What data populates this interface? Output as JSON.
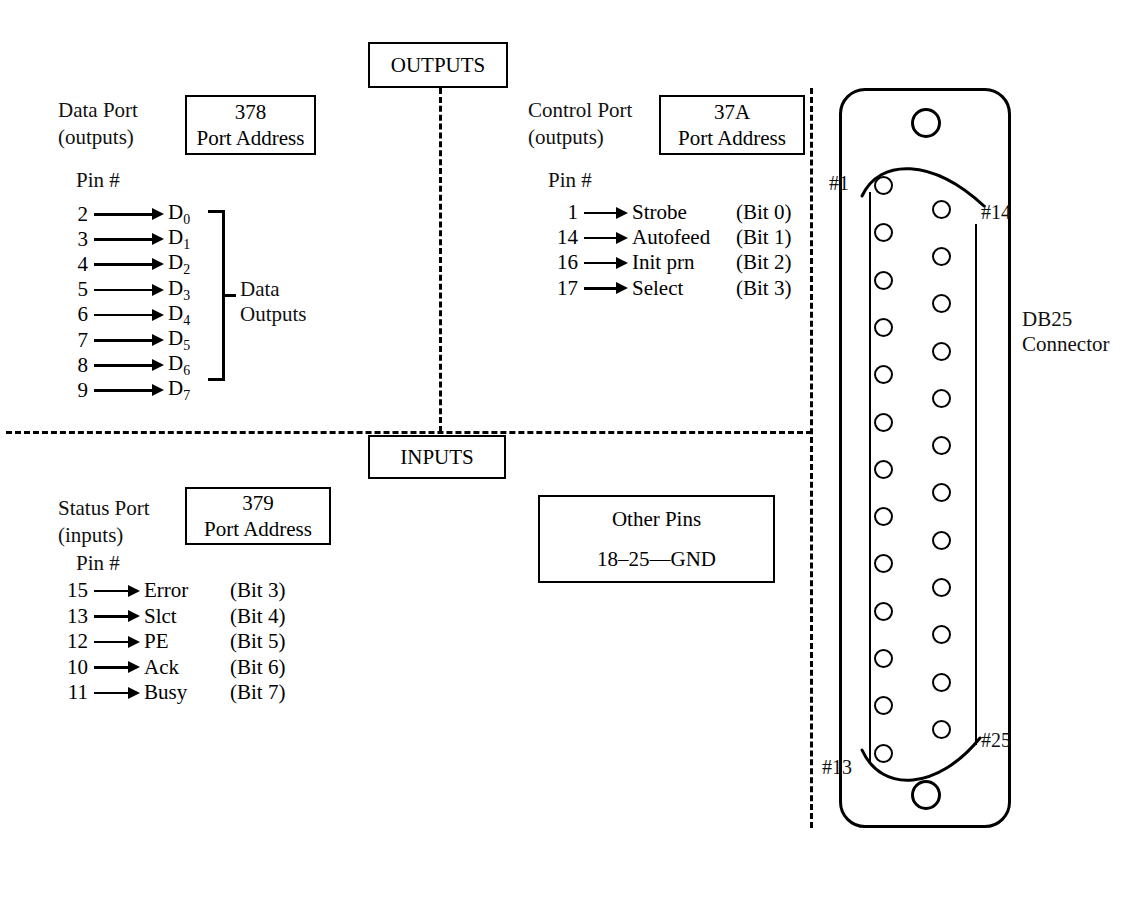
{
  "diagram": {
    "section_outputs_label": "OUTPUTS",
    "section_inputs_label": "INPUTS",
    "connector_label_line1": "DB25",
    "connector_label_line2": "Connector",
    "pin_number_heading": "Pin #",
    "port_address_caption": "Port Address"
  },
  "data_port": {
    "name_line1": "Data Port",
    "name_line2": "(outputs)",
    "address": "378",
    "address_caption": "Port Address",
    "pin_heading": "Pin #",
    "group_label_line1": "Data",
    "group_label_line2": "Outputs",
    "rows": [
      {
        "pin": "2",
        "signal": "D",
        "sub": "0"
      },
      {
        "pin": "3",
        "signal": "D",
        "sub": "1"
      },
      {
        "pin": "4",
        "signal": "D",
        "sub": "2"
      },
      {
        "pin": "5",
        "signal": "D",
        "sub": "3"
      },
      {
        "pin": "6",
        "signal": "D",
        "sub": "4"
      },
      {
        "pin": "7",
        "signal": "D",
        "sub": "5"
      },
      {
        "pin": "8",
        "signal": "D",
        "sub": "6"
      },
      {
        "pin": "9",
        "signal": "D",
        "sub": "7"
      }
    ]
  },
  "control_port": {
    "name_line1": "Control Port",
    "name_line2": "(outputs)",
    "address": "37A",
    "address_caption": "Port Address",
    "pin_heading": "Pin #",
    "rows": [
      {
        "pin": "1",
        "signal": "Strobe",
        "bit": "(Bit 0)"
      },
      {
        "pin": "14",
        "signal": "Autofeed",
        "bit": "(Bit 1)"
      },
      {
        "pin": "16",
        "signal": "Init prn",
        "bit": "(Bit 2)"
      },
      {
        "pin": "17",
        "signal": "Select",
        "bit": "(Bit 3)"
      }
    ]
  },
  "status_port": {
    "name_line1": "Status Port",
    "name_line2": "(inputs)",
    "address": "379",
    "address_caption": "Port Address",
    "pin_heading": "Pin #",
    "rows": [
      {
        "pin": "15",
        "signal": "Error",
        "bit": "(Bit 3)"
      },
      {
        "pin": "13",
        "signal": "Slct",
        "bit": "(Bit 4)"
      },
      {
        "pin": "12",
        "signal": "PE",
        "bit": "(Bit 5)"
      },
      {
        "pin": "10",
        "signal": "Ack",
        "bit": "(Bit 6)"
      },
      {
        "pin": "11",
        "signal": "Busy",
        "bit": "(Bit 7)"
      }
    ]
  },
  "other_pins": {
    "heading": "Other Pins",
    "detail": "18–25—GND"
  },
  "connector": {
    "label_line1": "DB25",
    "label_line2": "Connector",
    "pin_labels": {
      "first_left": "#1",
      "first_right": "#14",
      "last_left": "#13",
      "last_right": "#25"
    },
    "left_column_pin_count": 13,
    "right_column_pin_count": 12,
    "mounting_holes": 2
  },
  "colors": {
    "ink": "#000000",
    "background": "#ffffff"
  }
}
